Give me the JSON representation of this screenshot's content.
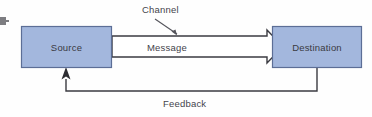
{
  "figure": {
    "type": "communication-process-diagram",
    "background_color": "#fefefe",
    "line_color": "#3b3b41",
    "text_color": "#3a3a42"
  },
  "nodes": [
    {
      "id": "source",
      "label": "Source",
      "fill_color": "#a3b7dd",
      "border_color": "#5c6e96",
      "x": 21,
      "y": 26,
      "width": 91,
      "height": 42
    },
    {
      "id": "destination",
      "label": "Destination",
      "fill_color": "#a3b7dd",
      "border_color": "#5c6e96",
      "x": 272,
      "y": 26,
      "width": 90,
      "height": 42
    }
  ],
  "edges": [
    {
      "id": "message",
      "label": "Message",
      "from": "source",
      "to": "destination",
      "style": "hollow-block-arrow",
      "fill_color": "#ffffff",
      "stroke_color": "#3b3b41",
      "direction": "left-to-right"
    },
    {
      "id": "feedback",
      "label": "Feedback",
      "from": "destination",
      "to": "source",
      "style": "thin-line-with-solid-arrowhead",
      "stroke_color": "#3b3b41",
      "direction": "right-to-left"
    }
  ],
  "annotations": [
    {
      "id": "channel",
      "label": "Channel",
      "style": "leader-line",
      "points_to": "message",
      "stroke_color": "#55555c"
    }
  ],
  "artifacts": {
    "left_margin_fragment": "cropped-glyph"
  }
}
